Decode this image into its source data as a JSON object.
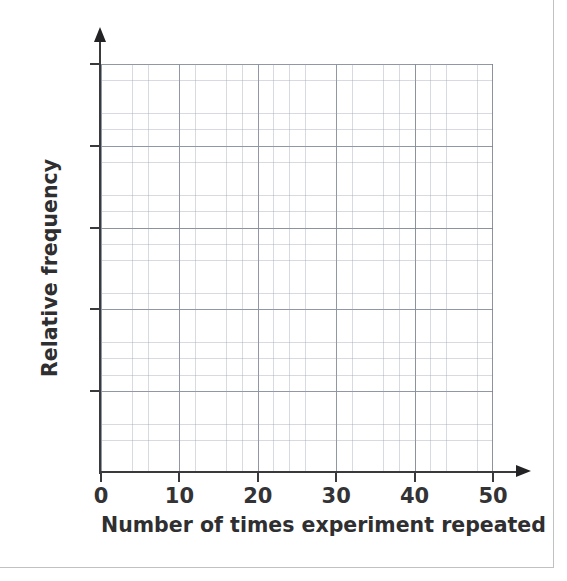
{
  "page": {
    "background_color": "#ffffff",
    "border_color": "#bfc1c3"
  },
  "chart_data": {
    "type": "line",
    "title": "",
    "subtitle": "",
    "xlabel": "Number of times experiment repeated",
    "ylabel": "Relative frequency",
    "x": [],
    "series": [],
    "values": [],
    "categories": [],
    "xlim": [
      0,
      50
    ],
    "ylim": [
      0,
      1
    ],
    "x_ticks": [
      0,
      10,
      20,
      30,
      40,
      50
    ],
    "x_tick_labels": [
      "0",
      "10",
      "20",
      "30",
      "40",
      "50"
    ],
    "y_ticks": [
      0,
      1,
      2,
      3,
      4,
      5
    ],
    "y_tick_labels": [
      "",
      "",
      "",
      "",
      "",
      ""
    ],
    "grid": true,
    "grid_major_color": "#78808c",
    "grid_minor_color": "#96a0af",
    "grid_minor_per_major": 5,
    "legend": null,
    "legend_position": "none",
    "annotations": [],
    "note": "Empty graph paper axes with no plotted data points"
  },
  "axes": {
    "x_axis_color": "#3a3a3c",
    "y_axis_color": "#3a3a3c",
    "x_arrow": "arrow-right",
    "y_arrow": "arrow-up"
  }
}
